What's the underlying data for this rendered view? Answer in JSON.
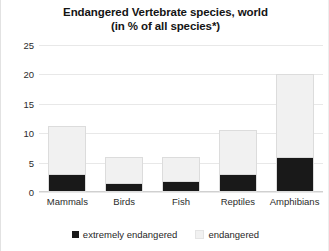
{
  "chart_data": {
    "type": "bar",
    "subtype": "stacked-column",
    "title": "Endangered Vertebrate species, world",
    "subtitle": "(in % of all species*)",
    "xlabel": "",
    "ylabel": "",
    "ylim": [
      0,
      25
    ],
    "yticks": [
      0,
      5,
      10,
      15,
      20,
      25
    ],
    "grid": true,
    "legend_position": "bottom",
    "categories": [
      "Mammals",
      "Birds",
      "Fish",
      "Reptiles",
      "Amphibians"
    ],
    "series": [
      {
        "name": "extremely endangered",
        "color": "#191919",
        "values": [
          3,
          1.5,
          1.8,
          3,
          6
        ]
      },
      {
        "name": "endangered",
        "color": "#f1f1f1",
        "values": [
          8.2,
          4.5,
          4.2,
          7.5,
          14
        ]
      }
    ],
    "totals": [
      11.2,
      6,
      6,
      10.5,
      20
    ]
  },
  "legend": {
    "items": [
      {
        "label": "extremely endangered",
        "swatch": "black-square-icon"
      },
      {
        "label": "endangered",
        "swatch": "light-gray-square-icon"
      }
    ]
  }
}
